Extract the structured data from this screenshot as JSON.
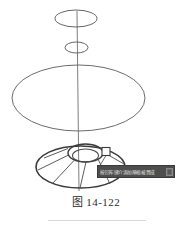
{
  "figure": {
    "caption_label": "图",
    "caption_number": "14-122"
  },
  "tooltip": {
    "text": "按回车键介添加移植被置成",
    "icon": "down-arrow-icon",
    "background_color": "#4e4e4e",
    "text_color": "#e8e8e8"
  },
  "drawing": {
    "line_color": "#555555",
    "heavy_line_color": "#3b3b3b",
    "axis_color": "#6b6b6b",
    "title": "灯罩三维建模",
    "elements": [
      {
        "name": "top-ellipse",
        "type": "ellipse",
        "cx": 76,
        "cy": 18.5,
        "rx": 21,
        "ry": 8.5
      },
      {
        "name": "upper-small-ellipse",
        "type": "ellipse",
        "cx": 76.5,
        "cy": 47.5,
        "rx": 11.5,
        "ry": 5.5
      },
      {
        "name": "large-ellipse",
        "type": "ellipse",
        "cx": 78.5,
        "cy": 98,
        "rx": 66.5,
        "ry": 33
      },
      {
        "name": "cone-base-ellipse",
        "type": "ellipse",
        "cx": 80.5,
        "cy": 167,
        "rx": 44.5,
        "ry": 21
      },
      {
        "name": "cone-top-ellipse",
        "type": "ellipse",
        "cx": 85.5,
        "cy": 153,
        "rx": 17.5,
        "ry": 9
      },
      {
        "name": "cone-inner-ellipse",
        "type": "ellipse",
        "cx": 85.5,
        "cy": 155,
        "rx": 13,
        "ry": 6.5
      },
      {
        "name": "vertical-axis",
        "type": "line",
        "x1": 77,
        "y1": 11,
        "x2": 79,
        "y2": 190
      },
      {
        "name": "grip-square",
        "type": "rect",
        "x": 102,
        "y": 148,
        "w": 8,
        "h": 8
      }
    ],
    "radial_line_count": 6
  }
}
